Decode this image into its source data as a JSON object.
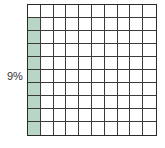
{
  "figure": {
    "label": "9%",
    "grid": {
      "rows": 10,
      "cols": 10,
      "shaded_count": 9,
      "shaded_color": "#b8d5c6",
      "shaded_cells": [
        [
          1,
          0
        ],
        [
          2,
          0
        ],
        [
          3,
          0
        ],
        [
          4,
          0
        ],
        [
          5,
          0
        ],
        [
          6,
          0
        ],
        [
          7,
          0
        ],
        [
          8,
          0
        ],
        [
          9,
          0
        ]
      ]
    }
  }
}
